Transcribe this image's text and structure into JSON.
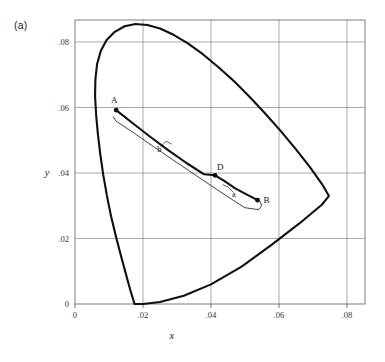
{
  "figure": {
    "panel_label": "(a)"
  },
  "chart_data": {
    "type": "line",
    "title": "",
    "subtitle": "",
    "xlabel": "x",
    "ylabel": "y",
    "xlim": [
      -0.002,
      0.0855
    ],
    "ylim": [
      -0.0045,
      0.0895
    ],
    "grid": true,
    "legend": null,
    "x_ticks": [
      0,
      0.02,
      0.04,
      0.06,
      0.08
    ],
    "x_tick_labels": [
      "0",
      ".02",
      ".04",
      ".06",
      ".08"
    ],
    "y_ticks": [
      0,
      0.02,
      0.04,
      0.06,
      0.08
    ],
    "y_tick_labels": [
      "0",
      ".02",
      ".04",
      ".06",
      ".08"
    ],
    "annotations": [
      {
        "name": "point-A",
        "label": "A",
        "x": 0.0121,
        "y": 0.0592,
        "label_dx": -2,
        "label_dy": -7
      },
      {
        "name": "point-D",
        "label": "D",
        "x": 0.0412,
        "y": 0.0393,
        "label_dx": 2,
        "label_dy": -5
      },
      {
        "name": "point-B",
        "label": "B",
        "x": 0.0537,
        "y": 0.0317,
        "label_dx": 6,
        "label_dy": 3
      },
      {
        "name": "curve-label-b",
        "label": "b",
        "x": 0.0248,
        "y": 0.0463,
        "label_dx": 0,
        "label_dy": 0
      },
      {
        "name": "curve-label-a",
        "label": "a",
        "x": 0.0467,
        "y": 0.0327,
        "label_dx": 0,
        "label_dy": 0
      }
    ],
    "series": [
      {
        "name": "spectral-locus",
        "style": "thick-closed-outline",
        "points": [
          [
            0.0175,
            0.0
          ],
          [
            0.0162,
            0.0045
          ],
          [
            0.0148,
            0.0098
          ],
          [
            0.0134,
            0.0152
          ],
          [
            0.012,
            0.0208
          ],
          [
            0.0106,
            0.0268
          ],
          [
            0.0094,
            0.033
          ],
          [
            0.0083,
            0.0395
          ],
          [
            0.0074,
            0.046
          ],
          [
            0.0067,
            0.0522
          ],
          [
            0.0062,
            0.058
          ],
          [
            0.0059,
            0.0634
          ],
          [
            0.006,
            0.0686
          ],
          [
            0.0065,
            0.0733
          ],
          [
            0.0076,
            0.0773
          ],
          [
            0.0093,
            0.0806
          ],
          [
            0.0117,
            0.0831
          ],
          [
            0.0146,
            0.0848
          ],
          [
            0.0178,
            0.0855
          ],
          [
            0.0213,
            0.0852
          ],
          [
            0.025,
            0.0841
          ],
          [
            0.029,
            0.0822
          ],
          [
            0.0332,
            0.0796
          ],
          [
            0.0377,
            0.0762
          ],
          [
            0.0422,
            0.0723
          ],
          [
            0.0468,
            0.068
          ],
          [
            0.0514,
            0.0632
          ],
          [
            0.056,
            0.0581
          ],
          [
            0.0606,
            0.0527
          ],
          [
            0.065,
            0.0472
          ],
          [
            0.0691,
            0.0418
          ],
          [
            0.0726,
            0.0367
          ],
          [
            0.0747,
            0.033
          ],
          [
            0.0726,
            0.0303
          ],
          [
            0.066,
            0.0246
          ],
          [
            0.058,
            0.0182
          ],
          [
            0.049,
            0.0114
          ],
          [
            0.04,
            0.006
          ],
          [
            0.032,
            0.0025
          ],
          [
            0.025,
            0.0006
          ],
          [
            0.02,
            0.0
          ],
          [
            0.0175,
            0.0
          ]
        ]
      },
      {
        "name": "planckian-locus-b",
        "style": "thick",
        "points": [
          [
            0.0121,
            0.0592
          ],
          [
            0.017,
            0.0552
          ],
          [
            0.0222,
            0.051
          ],
          [
            0.0275,
            0.0469
          ],
          [
            0.033,
            0.0429
          ],
          [
            0.038,
            0.0396
          ],
          [
            0.0412,
            0.0393
          ],
          [
            0.044,
            0.0375
          ],
          [
            0.047,
            0.0354
          ],
          [
            0.05,
            0.0337
          ],
          [
            0.0537,
            0.0317
          ]
        ]
      },
      {
        "name": "daylight-locus-a",
        "style": "thin",
        "points": [
          [
            0.0113,
            0.0572
          ],
          [
            0.012,
            0.0559
          ],
          [
            0.0175,
            0.0521
          ],
          [
            0.0232,
            0.048
          ],
          [
            0.0288,
            0.044
          ],
          [
            0.0344,
            0.0401
          ],
          [
            0.0398,
            0.0363
          ],
          [
            0.045,
            0.0327
          ],
          [
            0.05,
            0.0294
          ],
          [
            0.054,
            0.0288
          ],
          [
            0.0549,
            0.03
          ],
          [
            0.0545,
            0.0312
          ]
        ]
      }
    ],
    "leaders": [
      {
        "name": "leader-b",
        "points": [
          [
            0.0253,
            0.0481
          ],
          [
            0.0268,
            0.0497
          ],
          [
            0.0283,
            0.0489
          ]
        ]
      },
      {
        "name": "leader-a",
        "points": [
          [
            0.0466,
            0.0341
          ],
          [
            0.045,
            0.0357
          ],
          [
            0.0435,
            0.0364
          ]
        ]
      }
    ]
  }
}
